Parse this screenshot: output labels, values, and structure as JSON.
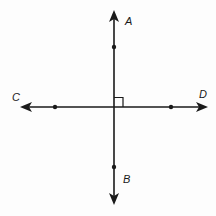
{
  "figure": {
    "line_color": "#1a1a1a",
    "lines": [
      {
        "name": "AB",
        "orientation": "vertical",
        "arrows": "both"
      },
      {
        "name": "CD",
        "orientation": "horizontal",
        "arrows": "both"
      }
    ],
    "labels": {
      "A": "A",
      "B": "B",
      "C": "C",
      "D": "D"
    },
    "right_angle_marker": true
  }
}
